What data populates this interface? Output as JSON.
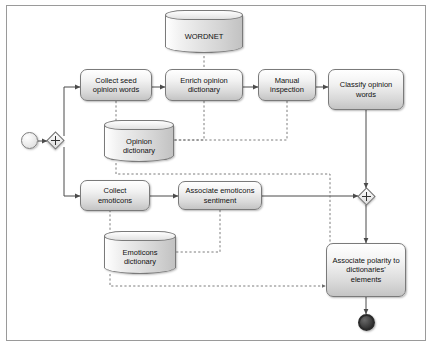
{
  "diagram": {
    "nodes": {
      "wordnet": {
        "label": "WORDNET"
      },
      "collect_seed": {
        "label": "Collect seed\nopinion words"
      },
      "enrich": {
        "label": "Enrich opinion\ndictionary"
      },
      "manual": {
        "label": "Manual\ninspection"
      },
      "classify": {
        "label": "Classify opinion\nwords"
      },
      "opinion_dict": {
        "label": "Opinion\ndictionary"
      },
      "collect_emoticons": {
        "label": "Collect\nemoticons"
      },
      "associate_emoticons": {
        "label": "Associate emoticons\nsentiment"
      },
      "emoticons_dict": {
        "label": "Emoticons\ndictionary"
      },
      "associate_polarity": {
        "label": "Associate polarity to\ndictionaries'\nelements"
      },
      "start_event": {
        "label": ""
      },
      "gateway_split": {
        "label": "+"
      },
      "gateway_join": {
        "label": "+"
      },
      "end_event": {
        "label": ""
      }
    },
    "colors": {
      "shape_border": "#7a7a7a",
      "shape_fill_light": "#ffffff",
      "shape_fill_dark": "#c4c4c4",
      "flow_line": "#4b4b4b",
      "association_line": "#6e6e6e",
      "end_event_fill": "#1c1c1c",
      "frame_border": "#9a9a9a"
    }
  }
}
